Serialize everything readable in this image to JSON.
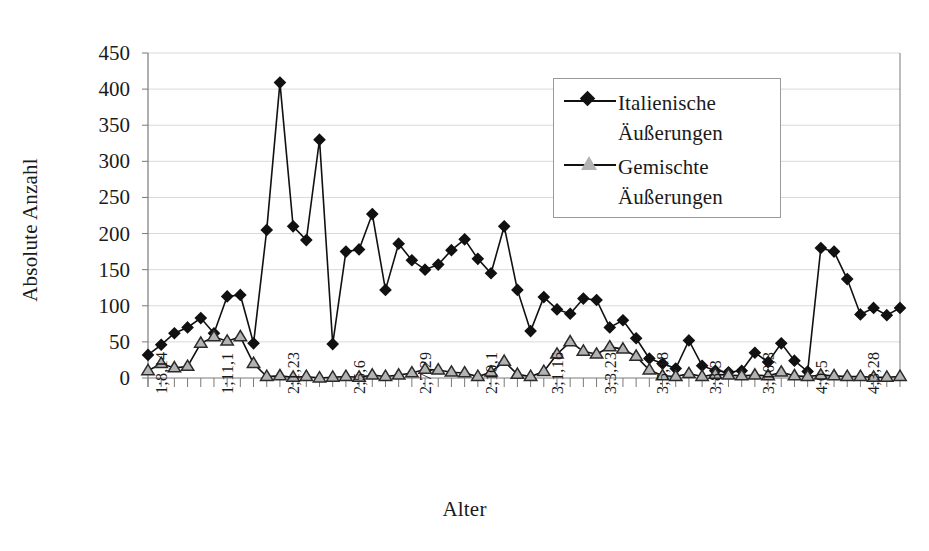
{
  "chart_data": {
    "type": "line",
    "title": "",
    "xlabel": "Alter",
    "ylabel": "Absolute Anzahl",
    "ylim": [
      0,
      450
    ],
    "yticks": [
      0,
      50,
      100,
      150,
      200,
      250,
      300,
      350,
      400,
      450
    ],
    "grid": true,
    "legend_position": "top-right",
    "x_tick_labels_shown": [
      "1;8,14",
      "1;11,1",
      "2;1,23",
      "2;5,6",
      "2;7,29",
      "2;10,1",
      "3;1,16",
      "3;3,23",
      "3;5,18",
      "3;8,3",
      "3;10,3",
      "4;0,5",
      "4;3,28"
    ],
    "x_label_tick_indices": [
      0,
      5,
      10,
      15,
      20,
      25,
      30,
      34,
      38,
      42,
      46,
      50,
      54
    ],
    "n_points": 56,
    "series": [
      {
        "name": "Italienische Äußerungen",
        "marker": "diamond-filled",
        "color": "#111111",
        "values": [
          32,
          46,
          62,
          70,
          83,
          62,
          113,
          115,
          48,
          205,
          409,
          210,
          191,
          330,
          47,
          175,
          178,
          227,
          122,
          186,
          163,
          150,
          157,
          177,
          192,
          165,
          145,
          210,
          122,
          65,
          112,
          95,
          89,
          110,
          108,
          70,
          80,
          55,
          27,
          20,
          13,
          52,
          17,
          10,
          8,
          10,
          35,
          22,
          48,
          24,
          9,
          180,
          175,
          137,
          88,
          97,
          87,
          97
        ]
      },
      {
        "name": "Gemischte Äußerungen",
        "marker": "triangle-open",
        "color": "#b3b3b3",
        "values": [
          10,
          20,
          14,
          16,
          48,
          57,
          51,
          57,
          20,
          2,
          3,
          1,
          2,
          0,
          1,
          2,
          1,
          4,
          2,
          4,
          7,
          12,
          11,
          8,
          7,
          2,
          8,
          23,
          5,
          2,
          9,
          33,
          50,
          37,
          33,
          43,
          40,
          30,
          11,
          3,
          2,
          6,
          2,
          5,
          4,
          3,
          4,
          3,
          8,
          3,
          2,
          4,
          3,
          2,
          2,
          1,
          1,
          2
        ]
      }
    ]
  },
  "legend": {
    "entries": [
      {
        "label": "Italienische\nÄußerungen",
        "marker": "diamond-filled"
      },
      {
        "label": "Gemischte\nÄußerungen",
        "marker": "triangle-open"
      }
    ]
  },
  "axes": {
    "y_title": "Absolute Anzahl",
    "x_title": "Alter"
  },
  "colors": {
    "line": "#111111",
    "triangle_fill": "#b3b3b3",
    "grid": "#d9d9d9",
    "frame": "#7a7a7a",
    "text": "#1a1a1a"
  }
}
